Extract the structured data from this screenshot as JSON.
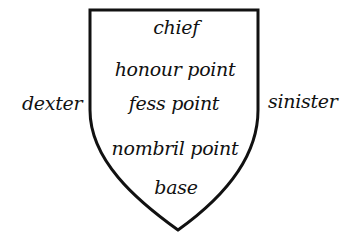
{
  "diagram": {
    "shield": {
      "stroke_color": "#111111",
      "fill_color": "#ffffff"
    },
    "points": [
      {
        "id": "chief",
        "label": "chief"
      },
      {
        "id": "honour-point",
        "label": "honour point"
      },
      {
        "id": "fess-point",
        "label": "fess point"
      },
      {
        "id": "nombril-point",
        "label": "nombril point"
      },
      {
        "id": "base",
        "label": "base"
      }
    ],
    "sides": {
      "left": "dexter",
      "right": "sinister"
    }
  }
}
